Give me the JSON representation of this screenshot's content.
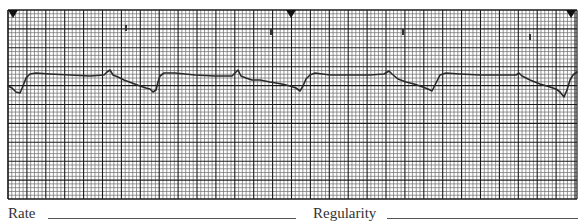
{
  "strip": {
    "grid": {
      "left": 8,
      "top": 10,
      "right": 577,
      "bottom": 199,
      "major_spacing": 18.9,
      "minor_divisions": 5,
      "major_color": "#1a1a1a",
      "minor_color": "#6a6a6a"
    },
    "markers": [
      {
        "x": 13,
        "y": 10
      },
      {
        "x": 291,
        "y": 10
      },
      {
        "x": 571,
        "y": 10
      }
    ],
    "artifacts": [
      {
        "x": 125,
        "y": 25
      },
      {
        "x": 270,
        "y": 29
      },
      {
        "x": 402,
        "y": 29
      },
      {
        "x": 529,
        "y": 34
      }
    ],
    "trace_color": "#2a2a2a",
    "trace_points": [
      [
        8,
        86
      ],
      [
        12,
        88
      ],
      [
        16,
        92
      ],
      [
        20,
        93
      ],
      [
        23,
        86
      ],
      [
        26,
        78
      ],
      [
        30,
        74
      ],
      [
        36,
        73
      ],
      [
        50,
        74
      ],
      [
        70,
        75
      ],
      [
        90,
        76
      ],
      [
        104,
        75
      ],
      [
        107,
        72
      ],
      [
        110,
        70
      ],
      [
        113,
        75
      ],
      [
        118,
        77
      ],
      [
        124,
        80
      ],
      [
        132,
        83
      ],
      [
        140,
        86
      ],
      [
        146,
        88
      ],
      [
        150,
        89
      ],
      [
        153,
        92
      ],
      [
        156,
        90
      ],
      [
        158,
        82
      ],
      [
        160,
        76
      ],
      [
        164,
        73
      ],
      [
        175,
        73
      ],
      [
        195,
        75
      ],
      [
        215,
        76
      ],
      [
        232,
        76
      ],
      [
        236,
        72
      ],
      [
        238,
        70
      ],
      [
        241,
        76
      ],
      [
        246,
        78
      ],
      [
        252,
        80
      ],
      [
        260,
        80
      ],
      [
        270,
        82
      ],
      [
        282,
        84
      ],
      [
        290,
        86
      ],
      [
        296,
        88
      ],
      [
        300,
        91
      ],
      [
        303,
        86
      ],
      [
        306,
        79
      ],
      [
        310,
        75
      ],
      [
        315,
        73
      ],
      [
        330,
        75
      ],
      [
        350,
        75
      ],
      [
        370,
        75
      ],
      [
        384,
        74
      ],
      [
        389,
        71
      ],
      [
        392,
        74
      ],
      [
        398,
        79
      ],
      [
        406,
        82
      ],
      [
        414,
        84
      ],
      [
        420,
        86
      ],
      [
        428,
        89
      ],
      [
        432,
        91
      ],
      [
        440,
        75
      ],
      [
        446,
        73
      ],
      [
        460,
        74
      ],
      [
        480,
        75
      ],
      [
        500,
        75
      ],
      [
        516,
        75
      ],
      [
        519,
        73
      ],
      [
        522,
        76
      ],
      [
        530,
        80
      ],
      [
        540,
        84
      ],
      [
        550,
        87
      ],
      [
        556,
        89
      ],
      [
        560,
        92
      ],
      [
        564,
        97
      ],
      [
        567,
        90
      ],
      [
        570,
        80
      ],
      [
        573,
        75
      ],
      [
        577,
        72
      ]
    ]
  },
  "form": {
    "rate_label": "Rate",
    "regularity_label": "Regularity"
  }
}
